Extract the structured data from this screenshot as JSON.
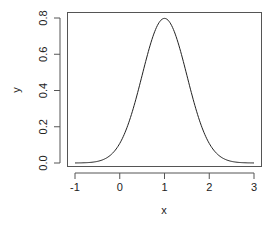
{
  "chart_data": {
    "type": "line",
    "title": "",
    "xlabel": "x",
    "ylabel": "y",
    "xlim": [
      -1.08,
      3.08
    ],
    "ylim": [
      -0.016,
      0.83
    ],
    "x_ticks": [
      -1,
      0,
      1,
      2,
      3
    ],
    "x_tick_labels": [
      "-1",
      "0",
      "1",
      "2",
      "3"
    ],
    "y_ticks": [
      0.0,
      0.2,
      0.4,
      0.6,
      0.8
    ],
    "y_tick_labels": [
      "0.0",
      "0.2",
      "0.4",
      "0.6",
      "0.8"
    ],
    "grid": false,
    "legend": null,
    "series": [
      {
        "name": "normal density (mean=1, sd=0.5)",
        "function": "dnorm(x, mean=1, sd=0.5)",
        "x": [
          -1,
          -0.75,
          -0.5,
          -0.25,
          0,
          0.25,
          0.5,
          0.75,
          1,
          1.25,
          1.5,
          1.75,
          2,
          2.25,
          2.5,
          2.75,
          3
        ],
        "y": [
          0.0003,
          0.0018,
          0.0089,
          0.035,
          0.108,
          0.259,
          0.484,
          0.704,
          0.798,
          0.704,
          0.484,
          0.259,
          0.108,
          0.035,
          0.0089,
          0.0018,
          0.0003
        ],
        "color": "#222222"
      }
    ]
  }
}
